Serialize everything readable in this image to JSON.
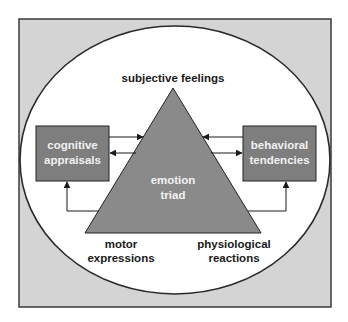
{
  "diagram": {
    "center_label": {
      "line1": "emotion",
      "line2": "triad"
    },
    "top_label": "subjective feelings",
    "bottom_left_label": {
      "line1": "motor",
      "line2": "expressions"
    },
    "bottom_right_label": {
      "line1": "physiological",
      "line2": "reactions"
    },
    "left_box": {
      "line1": "cognitive",
      "line2": "appraisals"
    },
    "right_box": {
      "line1": "behavioral",
      "line2": "tendencies"
    }
  },
  "colors": {
    "frame_fill": "#d4d4d4",
    "frame_border": "#3a3a3a",
    "ellipse_fill": "#ffffff",
    "triangle_fill": "#8a8a8a",
    "box_fill": "#7e7e7e",
    "box_text": "#f2f2f2",
    "label_text": "#1a1a1a"
  }
}
